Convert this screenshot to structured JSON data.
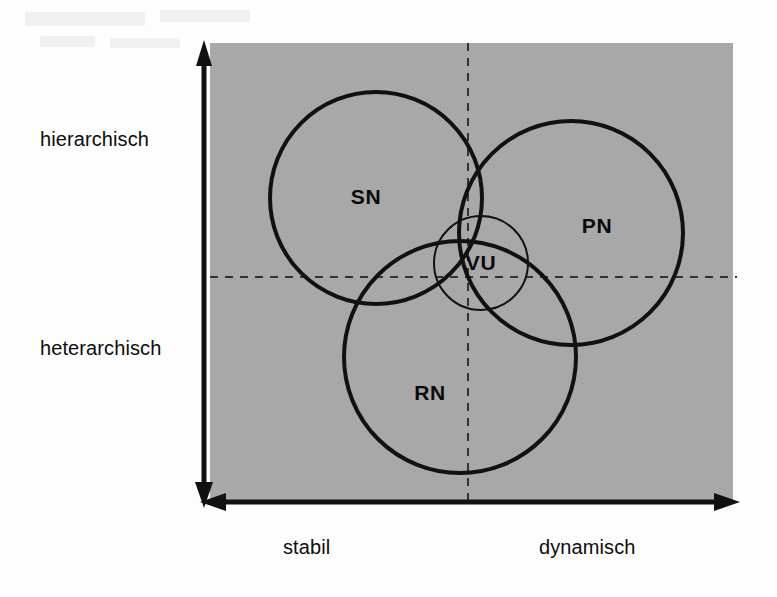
{
  "diagram": {
    "background_color": "#ffffff",
    "plot_area_color": "#a8a8a8",
    "axis_color": "#111111",
    "circle_stroke_color": "#111111",
    "dashed_guide_color": "#3a3a3a",
    "axes": {
      "vertical": {
        "name": "vertical-axis",
        "top_label": "hierarchisch",
        "bottom_label": "heterarchisch",
        "double_headed": true
      },
      "horizontal": {
        "name": "horizontal-axis",
        "left_label": "stabil",
        "right_label": "dynamisch",
        "double_headed": true
      }
    },
    "guides": {
      "vertical_dashed": true,
      "horizontal_dashed": true
    },
    "sets": [
      {
        "id": "sn",
        "label": "SN",
        "quadrant": "hierarchisch / stabil",
        "cx": 376,
        "cy": 198,
        "r": 106,
        "stroke_width": 4
      },
      {
        "id": "pn",
        "label": "PN",
        "quadrant": "hierarchisch / dynamisch",
        "cx": 571,
        "cy": 233,
        "r": 112,
        "stroke_width": 4
      },
      {
        "id": "rn",
        "label": "RN",
        "quadrant": "heterarchisch / stabil",
        "cx": 460,
        "cy": 357,
        "r": 116,
        "stroke_width": 4
      },
      {
        "id": "vu",
        "label": "VU",
        "quadrant": "center / intersection",
        "cx": 481,
        "cy": 263,
        "r": 47,
        "stroke_width": 2
      }
    ]
  },
  "chart_data": {
    "type": "scatter",
    "xlabel": "stabil – dynamisch",
    "ylabel": "hierarchisch – heterarchisch",
    "x_tick_labels": [
      "stabil",
      "dynamisch"
    ],
    "y_tick_labels": [
      "hierarchisch",
      "heterarchisch"
    ],
    "grid": "dashed-crosshair",
    "legend": "inline-labels",
    "series": [
      {
        "name": "SN",
        "cx": 376,
        "cy": 198,
        "r": 106
      },
      {
        "name": "PN",
        "cx": 571,
        "cy": 233,
        "r": 112
      },
      {
        "name": "RN",
        "cx": 460,
        "cy": 357,
        "r": 116
      },
      {
        "name": "VU",
        "cx": 481,
        "cy": 263,
        "r": 47
      }
    ],
    "annotations": [
      "SN",
      "PN",
      "RN",
      "VU"
    ]
  }
}
